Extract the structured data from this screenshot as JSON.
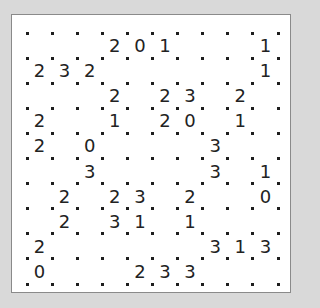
{
  "puzzle": {
    "type": "slitherlink",
    "rows": 10,
    "cols": 10,
    "colors": {
      "background": "#d9d9d9",
      "board": "#ffffff",
      "border": "#8a8a8a",
      "dot": "#1e1e1e",
      "clue": "#222222"
    },
    "grid": [
      [
        "",
        "",
        "",
        "2",
        "0",
        "1",
        "",
        "",
        "",
        "1"
      ],
      [
        "2",
        "3",
        "2",
        "",
        "",
        "",
        "",
        "",
        "",
        "1"
      ],
      [
        "",
        "",
        "",
        "2",
        "",
        "2",
        "3",
        "",
        "2",
        ""
      ],
      [
        "2",
        "",
        "",
        "1",
        "",
        "2",
        "0",
        "",
        "1",
        ""
      ],
      [
        "2",
        "",
        "0",
        "",
        "",
        "",
        "",
        "3",
        "",
        ""
      ],
      [
        "",
        "",
        "3",
        "",
        "",
        "",
        "",
        "3",
        "",
        "1"
      ],
      [
        "",
        "2",
        "",
        "2",
        "3",
        "",
        "2",
        "",
        "",
        "0"
      ],
      [
        "",
        "2",
        "",
        "3",
        "1",
        "",
        "1",
        "",
        "",
        ""
      ],
      [
        "2",
        "",
        "",
        "",
        "",
        "",
        "",
        "3",
        "1",
        "3"
      ],
      [
        "0",
        "",
        "",
        "",
        "2",
        "3",
        "3",
        "",
        "",
        ""
      ]
    ]
  }
}
